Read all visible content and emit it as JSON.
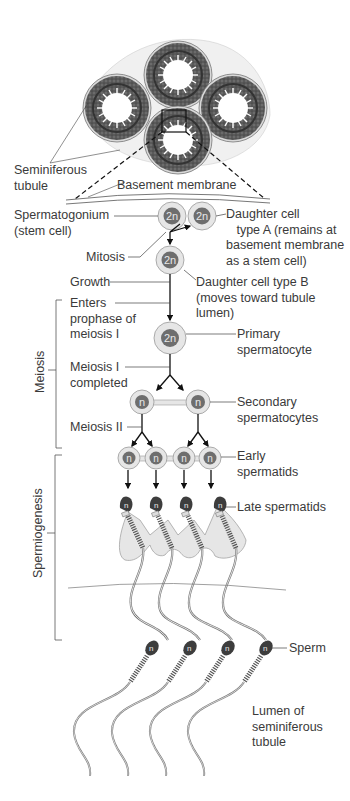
{
  "figure": {
    "labels": {
      "seminiferous_tubule": "Seminiferous\ntubule",
      "basement_membrane": "Basement membrane",
      "spermatogonium": "Spermatogonium\n(stem cell)",
      "daughter_a": "Daughter cell\n   type A (remains at\nbasement membrane\nas a stem cell)",
      "mitosis": "Mitosis",
      "growth": "Growth",
      "daughter_b": "Daughter cell type B\n(moves toward tubule\nlumen)",
      "enters_prophase": "Enters\nprophase of\nmeiosis I",
      "primary_spermatocyte": "Primary\nspermatocyte",
      "meiosis_i_completed": "Meiosis I\ncompleted",
      "secondary_spermatocytes": "Secondary\nspermatocytes",
      "meiosis_ii": "Meiosis II",
      "early_spermatids": "Early\nspermatids",
      "late_spermatids": "Late spermatids",
      "sperm": "Sperm",
      "lumen": "Lumen of\nseminiferous\ntubule"
    },
    "brackets": {
      "meiosis": "Meiosis",
      "spermiogenesis": "Spermiogenesis"
    },
    "ploidy": {
      "diploid": "2n",
      "haploid": "n"
    },
    "colors": {
      "text": "#3a3a3a",
      "cell_outer": "#e4e4e4",
      "cell_ring": "#9a9a9a",
      "nucleus": "#6e6e6e",
      "tubule_dark": "#4a4a4a",
      "sertoli": "#e6e6e6"
    }
  }
}
